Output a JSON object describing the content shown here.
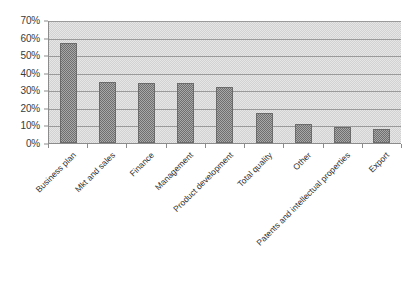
{
  "chart_data": {
    "type": "bar",
    "title": "",
    "subtitle": "",
    "xlabel": "",
    "ylabel": "",
    "ylim": [
      0,
      70
    ],
    "y_tick_step": 10,
    "y_tick_labels": [
      "70%",
      "60%",
      "50%",
      "40%",
      "30%",
      "20%",
      "10%",
      "0%"
    ],
    "y_tick_values": [
      70,
      60,
      50,
      40,
      30,
      20,
      10,
      0
    ],
    "grid": true,
    "legend": false,
    "legend_position": "none",
    "value_format": "percent",
    "categories": [
      "Business plan",
      "Mkt and sales",
      "Finance",
      "Management",
      "Product development",
      "Total quality",
      "Other",
      "Patents and intellectual properties",
      "Export"
    ],
    "values": [
      57,
      35,
      34,
      34,
      32,
      17,
      11,
      9,
      8
    ],
    "series": [
      {
        "name": "",
        "values": [
          57,
          35,
          34,
          34,
          32,
          17,
          11,
          9,
          8
        ]
      }
    ]
  },
  "style": {
    "bar_fill": "#8e8e8e",
    "bar_border": "#6b6b6b",
    "plot_background": "#dcdcdc",
    "gridline_color": "#9a9a9a",
    "axis_color": "#8c8c8c",
    "text_color": "#2f2f2f"
  }
}
